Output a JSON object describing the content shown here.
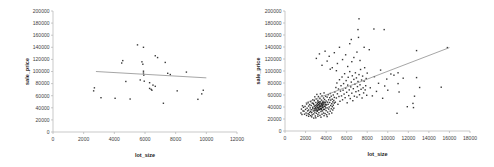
{
  "figure": {
    "background": "#ffffff",
    "point_color": "#1c1c1c",
    "axis_color": "#b3b3b3",
    "tick_label_color": "#3d3d3d",
    "axis_title_color": "#1a1a1a",
    "trend_color": "#8f8f8f"
  },
  "chart_data": [
    {
      "type": "scatter",
      "name": "left-plot",
      "title": "",
      "xlabel": "lot_size",
      "ylabel": "sale_price",
      "xlim": [
        0,
        12000
      ],
      "ylim": [
        0,
        200000
      ],
      "x_ticks": [
        0,
        2000,
        4000,
        6000,
        8000,
        10000,
        12000
      ],
      "y_ticks": [
        0,
        20000,
        40000,
        60000,
        80000,
        100000,
        120000,
        140000,
        160000,
        180000,
        200000
      ],
      "grid": false,
      "legend": "none",
      "trendline": {
        "x1": 2800,
        "y1": 100000,
        "x2": 10000,
        "y2": 89500
      },
      "points": [
        [
          2700,
          73000
        ],
        [
          2650,
          68000
        ],
        [
          3130,
          56700
        ],
        [
          4050,
          55700
        ],
        [
          5030,
          54500
        ],
        [
          4750,
          83500
        ],
        [
          4550,
          118000
        ],
        [
          4480,
          114000
        ],
        [
          5510,
          144000
        ],
        [
          5900,
          140000
        ],
        [
          6670,
          126000
        ],
        [
          6820,
          123000
        ],
        [
          5800,
          116000
        ],
        [
          5860,
          112000
        ],
        [
          7320,
          115000
        ],
        [
          5900,
          100500
        ],
        [
          5900,
          97500
        ],
        [
          5920,
          94000
        ],
        [
          7480,
          97000
        ],
        [
          7650,
          95000
        ],
        [
          8700,
          99000
        ],
        [
          5690,
          86000
        ],
        [
          5950,
          84000
        ],
        [
          6300,
          81500
        ],
        [
          6520,
          77500
        ],
        [
          6670,
          75500
        ],
        [
          6300,
          72000
        ],
        [
          6400,
          70500
        ],
        [
          6450,
          69000
        ],
        [
          7200,
          47500
        ],
        [
          8100,
          68000
        ],
        [
          9450,
          54000
        ],
        [
          9700,
          63000
        ],
        [
          9800,
          69000
        ]
      ]
    },
    {
      "type": "scatter",
      "name": "right-plot",
      "title": "",
      "xlabel": "lot_size",
      "ylabel": "sale_price",
      "xlim": [
        0,
        18000
      ],
      "ylim": [
        0,
        200000
      ],
      "x_ticks": [
        0,
        2000,
        4000,
        6000,
        8000,
        10000,
        12000,
        14000,
        16000,
        18000
      ],
      "y_ticks": [
        0,
        20000,
        40000,
        60000,
        80000,
        100000,
        120000,
        140000,
        160000,
        180000,
        200000
      ],
      "grid": false,
      "legend": "none",
      "trendline": {
        "x1": 2000,
        "y1": 47000,
        "x2": 16000,
        "y2": 139000
      },
      "points": [
        [
          1850,
          33000
        ],
        [
          1900,
          28000
        ],
        [
          1950,
          41000
        ],
        [
          2000,
          36000
        ],
        [
          2050,
          30000
        ],
        [
          2100,
          45000
        ],
        [
          2100,
          26000
        ],
        [
          2150,
          38000
        ],
        [
          2200,
          33500
        ],
        [
          2250,
          29000
        ],
        [
          2250,
          47000
        ],
        [
          2300,
          41500
        ],
        [
          2300,
          35000
        ],
        [
          2350,
          27500
        ],
        [
          2400,
          44000
        ],
        [
          2400,
          31000
        ],
        [
          2450,
          38500
        ],
        [
          2500,
          25500
        ],
        [
          2500,
          49000
        ],
        [
          2550,
          35500
        ],
        [
          2550,
          42500
        ],
        [
          2600,
          30500
        ],
        [
          2650,
          46500
        ],
        [
          2650,
          27000
        ],
        [
          2700,
          39500
        ],
        [
          2700,
          52000
        ],
        [
          2750,
          33500
        ],
        [
          2800,
          44500
        ],
        [
          2800,
          28500
        ],
        [
          2850,
          50500
        ],
        [
          2850,
          37000
        ],
        [
          2900,
          31500
        ],
        [
          2900,
          57000
        ],
        [
          2950,
          42000
        ],
        [
          2950,
          25000
        ],
        [
          3000,
          47500
        ],
        [
          3000,
          35000
        ],
        [
          3050,
          53500
        ],
        [
          3050,
          29500
        ],
        [
          3100,
          40500
        ],
        [
          3100,
          61000
        ],
        [
          3150,
          33000
        ],
        [
          3150,
          45500
        ],
        [
          3200,
          27500
        ],
        [
          3200,
          51000
        ],
        [
          3250,
          38000
        ],
        [
          3250,
          57500
        ],
        [
          3300,
          43500
        ],
        [
          3300,
          30500
        ],
        [
          3350,
          48500
        ],
        [
          3350,
          35500
        ],
        [
          3400,
          26000
        ],
        [
          3400,
          54000
        ],
        [
          3450,
          41000
        ],
        [
          3450,
          62000
        ],
        [
          3500,
          32500
        ],
        [
          3500,
          46000
        ],
        [
          3550,
          37500
        ],
        [
          3550,
          51500
        ],
        [
          3600,
          28000
        ],
        [
          3600,
          58500
        ],
        [
          3650,
          43000
        ],
        [
          3650,
          33500
        ],
        [
          3700,
          49500
        ],
        [
          3700,
          39000
        ],
        [
          3750,
          55000
        ],
        [
          3750,
          30000
        ],
        [
          3800,
          45000
        ],
        [
          3800,
          63500
        ],
        [
          3850,
          36000
        ],
        [
          3850,
          52500
        ],
        [
          3900,
          41500
        ],
        [
          3900,
          29000
        ],
        [
          3950,
          47000
        ],
        [
          3950,
          58000
        ],
        [
          4000,
          34000
        ],
        [
          4000,
          50000
        ],
        [
          4050,
          43500
        ],
        [
          4050,
          27000
        ],
        [
          4100,
          56500
        ],
        [
          4100,
          38500
        ],
        [
          4150,
          48000
        ],
        [
          4150,
          31500
        ],
        [
          4200,
          60500
        ],
        [
          4200,
          44500
        ],
        [
          4250,
          36500
        ],
        [
          4250,
          52000
        ],
        [
          4300,
          40000
        ],
        [
          4300,
          28500
        ],
        [
          4350,
          55500
        ],
        [
          4350,
          47500
        ],
        [
          4400,
          33000
        ],
        [
          4400,
          62500
        ],
        [
          4450,
          42500
        ],
        [
          4450,
          51500
        ],
        [
          4500,
          37000
        ],
        [
          4500,
          58000
        ],
        [
          4550,
          45500
        ],
        [
          4550,
          30000
        ],
        [
          4600,
          53000
        ],
        [
          4600,
          40500
        ],
        [
          4650,
          48500
        ],
        [
          4650,
          35000
        ],
        [
          4700,
          60000
        ],
        [
          4700,
          43000
        ],
        [
          4750,
          51000
        ],
        [
          4750,
          38000
        ],
        [
          4800,
          56000
        ],
        [
          4800,
          46500
        ],
        [
          3200,
          34500
        ],
        [
          3400,
          36500
        ],
        [
          3600,
          42000
        ],
        [
          2500,
          32500
        ],
        [
          2700,
          37000
        ],
        [
          2900,
          34500
        ],
        [
          3100,
          36500
        ],
        [
          3300,
          39500
        ],
        [
          3500,
          41500
        ],
        [
          3700,
          44500
        ],
        [
          2600,
          23500
        ],
        [
          3000,
          22000
        ],
        [
          3200,
          24500
        ],
        [
          3500,
          23000
        ],
        [
          3800,
          25500
        ],
        [
          4100,
          24000
        ],
        [
          2300,
          24500
        ],
        [
          2800,
          21500
        ],
        [
          1550,
          30000
        ],
        [
          1600,
          36500
        ],
        [
          1650,
          27500
        ],
        [
          1700,
          42000
        ],
        [
          1750,
          33500
        ],
        [
          1800,
          39500
        ],
        [
          3150,
          42500
        ],
        [
          3250,
          44000
        ],
        [
          3350,
          40500
        ],
        [
          3450,
          37000
        ],
        [
          3550,
          44500
        ],
        [
          3250,
          47500
        ],
        [
          3150,
          39000
        ],
        [
          3350,
          46000
        ],
        [
          3450,
          48500
        ],
        [
          3550,
          35500
        ],
        [
          3650,
          39500
        ],
        [
          3750,
          47000
        ],
        [
          3850,
          41000
        ],
        [
          3950,
          38500
        ],
        [
          3050,
          43500
        ],
        [
          2950,
          39000
        ],
        [
          2850,
          41500
        ],
        [
          2750,
          46000
        ],
        [
          3650,
          47500
        ],
        [
          3750,
          36000
        ],
        [
          3850,
          48000
        ],
        [
          3950,
          44000
        ],
        [
          3300,
          36000
        ],
        [
          3400,
          43000
        ],
        [
          3500,
          38000
        ],
        [
          3600,
          45500
        ],
        [
          3700,
          41500
        ],
        [
          3200,
          48500
        ],
        [
          3100,
          33500
        ],
        [
          3000,
          37500
        ],
        [
          4850,
          65000
        ],
        [
          4900,
          48000
        ],
        [
          4950,
          72500
        ],
        [
          5000,
          55000
        ],
        [
          5050,
          80000
        ],
        [
          5100,
          62000
        ],
        [
          5150,
          44500
        ],
        [
          5200,
          70000
        ],
        [
          5250,
          57500
        ],
        [
          5300,
          85500
        ],
        [
          5350,
          49500
        ],
        [
          5400,
          66500
        ],
        [
          5450,
          75500
        ],
        [
          5500,
          58500
        ],
        [
          5550,
          90000
        ],
        [
          5600,
          52000
        ],
        [
          5650,
          68000
        ],
        [
          5700,
          79000
        ],
        [
          5750,
          61500
        ],
        [
          5800,
          95500
        ],
        [
          5850,
          55500
        ],
        [
          5900,
          71500
        ],
        [
          5950,
          84000
        ],
        [
          6000,
          64500
        ],
        [
          6050,
          47000
        ],
        [
          6100,
          76500
        ],
        [
          6150,
          89500
        ],
        [
          6200,
          59000
        ],
        [
          6250,
          68500
        ],
        [
          6300,
          99000
        ],
        [
          6350,
          54000
        ],
        [
          6400,
          73500
        ],
        [
          6450,
          81500
        ],
        [
          6500,
          63000
        ],
        [
          6550,
          92000
        ],
        [
          6600,
          50500
        ],
        [
          6650,
          70500
        ],
        [
          6700,
          86000
        ],
        [
          6750,
          58000
        ],
        [
          6800,
          78000
        ],
        [
          6850,
          97000
        ],
        [
          6900,
          65500
        ],
        [
          6950,
          88500
        ],
        [
          7000,
          56500
        ],
        [
          7050,
          74000
        ],
        [
          7100,
          82500
        ],
        [
          7150,
          67000
        ],
        [
          7200,
          94000
        ],
        [
          7250,
          60500
        ],
        [
          7300,
          77000
        ],
        [
          7350,
          102500
        ],
        [
          7400,
          69500
        ],
        [
          7450,
          85000
        ],
        [
          7500,
          55000
        ],
        [
          7550,
          91500
        ],
        [
          7600,
          72000
        ],
        [
          7650,
          63500
        ],
        [
          7700,
          83000
        ],
        [
          7750,
          105500
        ],
        [
          7800,
          68500
        ],
        [
          7850,
          75500
        ],
        [
          7900,
          87500
        ],
        [
          7950,
          59500
        ],
        [
          8000,
          96500
        ],
        [
          3050,
          121000
        ],
        [
          3350,
          128500
        ],
        [
          3600,
          109500
        ],
        [
          3900,
          133000
        ],
        [
          4100,
          116500
        ],
        [
          4300,
          124500
        ],
        [
          4600,
          105500
        ],
        [
          4800,
          130500
        ],
        [
          5100,
          112500
        ],
        [
          5300,
          139500
        ],
        [
          5600,
          119000
        ],
        [
          5900,
          127000
        ],
        [
          6100,
          107500
        ],
        [
          6300,
          145500
        ],
        [
          6500,
          115500
        ],
        [
          6700,
          122500
        ],
        [
          7000,
          131500
        ],
        [
          7300,
          117500
        ],
        [
          7700,
          139500
        ],
        [
          8200,
          135500
        ],
        [
          5000,
          100500
        ],
        [
          4400,
          103000
        ],
        [
          7200,
          187000
        ],
        [
          7100,
          169000
        ],
        [
          8650,
          170000
        ],
        [
          9650,
          169000
        ],
        [
          7150,
          156000
        ],
        [
          6450,
          152500
        ],
        [
          8300,
          72000
        ],
        [
          8500,
          58500
        ],
        [
          8700,
          90500
        ],
        [
          8900,
          66000
        ],
        [
          9100,
          79500
        ],
        [
          9300,
          101500
        ],
        [
          9500,
          54500
        ],
        [
          9700,
          75000
        ],
        [
          9900,
          86500
        ],
        [
          10000,
          68000
        ],
        [
          10300,
          95000
        ],
        [
          10600,
          93000
        ],
        [
          11000,
          97000
        ],
        [
          11000,
          79000
        ],
        [
          11100,
          65000
        ],
        [
          11500,
          88000
        ],
        [
          11900,
          40500
        ],
        [
          12450,
          46000
        ],
        [
          12500,
          39000
        ],
        [
          12600,
          58000
        ],
        [
          12800,
          89000
        ],
        [
          12800,
          134000
        ],
        [
          13100,
          72500
        ],
        [
          15200,
          73000
        ],
        [
          15800,
          139000
        ],
        [
          10900,
          29500
        ]
      ]
    }
  ]
}
